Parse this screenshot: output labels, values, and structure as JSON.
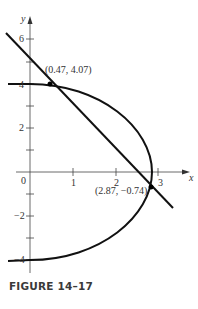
{
  "figure": {
    "caption": "FIGURE 14–17",
    "x_axis_label": "x",
    "y_axis_label": "y",
    "x_ticks": [
      "0",
      "1",
      "2",
      "3"
    ],
    "y_ticks": [
      "6",
      "4",
      "2",
      "−2",
      "−4"
    ],
    "points": [
      {
        "label": "(0.47, 4.07)",
        "x": 0.47,
        "y": 4.07
      },
      {
        "label": "(2.87, −0.74)",
        "x": 2.87,
        "y": -0.74
      }
    ],
    "curves": [
      "line",
      "half-ellipse"
    ]
  }
}
